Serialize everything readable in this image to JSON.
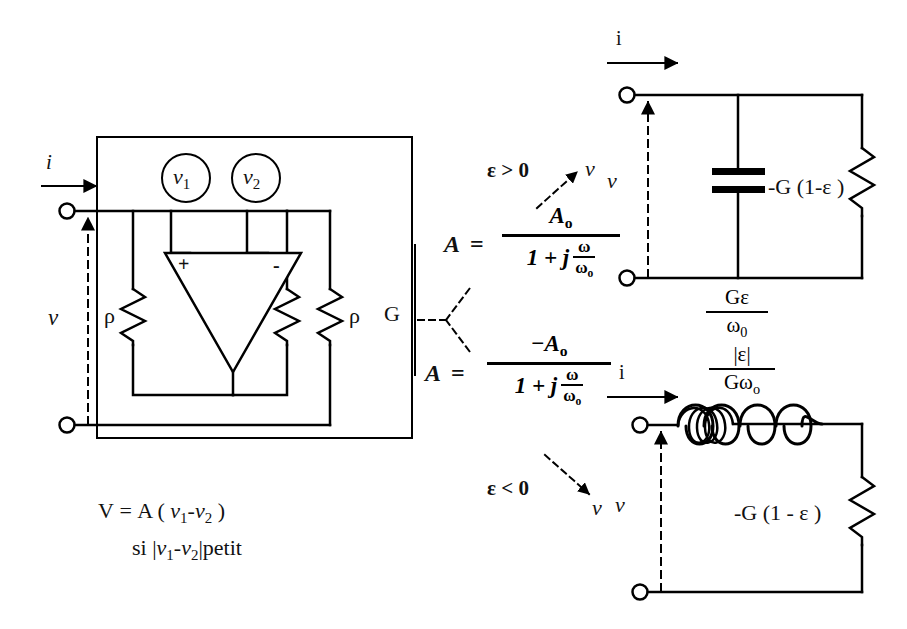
{
  "diagram": {
    "colors": {
      "ink": "#000000",
      "background": "#ffffff"
    }
  },
  "left_block": {
    "input_current_label": "i",
    "input_voltage_label": "v",
    "source_1_label": "v",
    "source_1_sub": "1",
    "source_2_label": "v",
    "source_2_sub": "2",
    "opamp_plus": "+",
    "opamp_minus": "-",
    "resistor_left_label": "ρ",
    "resistor_right_label": "ρ",
    "resistor_g_label": "G"
  },
  "caption": {
    "line1_prefix": "V",
    "line1_eq": "=",
    "line1_rest": "A ( ",
    "line1_v1": "v",
    "line1_v1_sub": "1",
    "line1_minus": "-",
    "line1_v2": "v",
    "line1_v2_sub": "2",
    "line1_close": " )",
    "line2_si": "si ",
    "line2_bar_open": "|",
    "line2_v1": "v",
    "line2_v1_sub": "1",
    "line2_minus": "-",
    "line2_v2": "v",
    "line2_v2_sub": "2",
    "line2_bar_close": "|",
    "line2_petit": "petit"
  },
  "formulas": {
    "top": {
      "lhs": "A",
      "eq": "=",
      "numerator": "A",
      "numerator_sub": "o",
      "denominator_lead": "1  +  j",
      "denom_frac_num": "ω",
      "denom_frac_den": "ω",
      "denom_frac_den_sub": "o"
    },
    "bottom": {
      "lhs": "A",
      "eq": "=",
      "numerator": "−A",
      "numerator_sub": "o",
      "denominator_lead": "1  +  j",
      "denom_frac_num": "ω",
      "denom_frac_den": "ω",
      "denom_frac_den_sub": "o"
    }
  },
  "conditions": {
    "epsilon_positive": "ε > 0",
    "epsilon_positive_target": "v",
    "epsilon_negative": "ε < 0",
    "epsilon_negative_target": "v"
  },
  "circuit_capacitive": {
    "current_label": "i",
    "voltage_label": "v",
    "capacitor_value_num": "Gε",
    "capacitor_value_den": "ω",
    "capacitor_value_den_sub": "0",
    "resistor_label": "-G (1-ε )"
  },
  "circuit_inductive": {
    "current_label": "i",
    "voltage_label": "v",
    "inductor_value_num": "|ε|",
    "inductor_value_den": "Gω",
    "inductor_value_den_sub": "o",
    "resistor_label": "-G (1 - ε )"
  }
}
